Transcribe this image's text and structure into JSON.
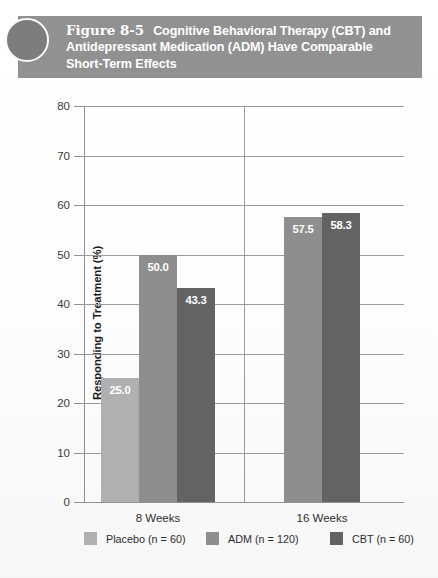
{
  "figure": {
    "number": "Figure 8-5",
    "title": "Cognitive Behavioral Therapy (CBT) and Antidepressant Medication (ADM) Have Comparable Short-Term Effects",
    "banner_color": "#919191",
    "banner_text_color": "#ffffff",
    "decoration_icon": "circle-bullet-icon"
  },
  "chart_data": {
    "type": "bar",
    "xlabel": "",
    "ylabel": "Responding to Treatment (%)",
    "ylim": [
      0,
      80
    ],
    "ytick_step": 10,
    "yticks": [
      0,
      10,
      20,
      30,
      40,
      50,
      60,
      70,
      80
    ],
    "ytick_labels": [
      "0",
      "10",
      "20",
      "30",
      "40",
      "50",
      "60",
      "70",
      "80"
    ],
    "categories": [
      "8 Weeks",
      "16 Weeks"
    ],
    "grid": "horizontal",
    "legend_position": "bottom",
    "series": [
      {
        "name": "Placebo (n = 60)",
        "short_name": "Placebo",
        "color": "#b0b0b0",
        "values": [
          25.0,
          null
        ],
        "value_labels": [
          "25.0",
          ""
        ]
      },
      {
        "name": "ADM (n = 120)",
        "short_name": "ADM",
        "color": "#8e8e8e",
        "values": [
          50.0,
          57.5
        ],
        "value_labels": [
          "50.0",
          "57.5"
        ]
      },
      {
        "name": "CBT (n = 60)",
        "short_name": "CBT",
        "color": "#636363",
        "values": [
          43.3,
          58.3
        ],
        "value_labels": [
          "43.3",
          "58.3"
        ]
      }
    ]
  }
}
